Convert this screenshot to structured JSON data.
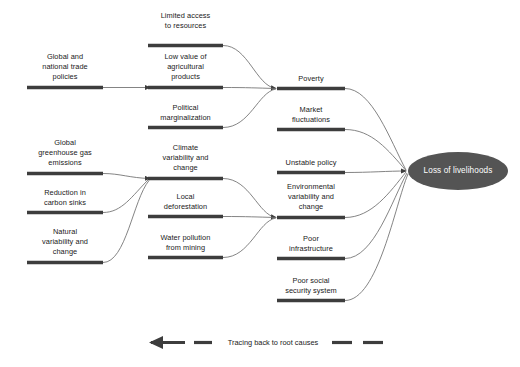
{
  "diagram": {
    "type": "root-cause-tracing-diagram",
    "colors": {
      "bar": "#3d3d3d",
      "connector": "#6e6e6e",
      "ellipse_fill": "#545454",
      "ellipse_text": "#ffffff",
      "text": "#1a1a1a",
      "background": "#ffffff"
    },
    "columns": [
      {
        "id": "root-causes",
        "nodes": [
          {
            "id": "global-national-trade-policies",
            "label": "Global and\nnational trade\npolicies",
            "bar_x": 27,
            "bar_w": 76,
            "bar_y": 87,
            "label_y": 52
          },
          {
            "id": "global-greenhouse-gas-emissions",
            "label": "Global\ngreenhouse gas\nemissions",
            "bar_x": 27,
            "bar_w": 76,
            "bar_y": 173,
            "label_y": 138
          },
          {
            "id": "reduction-in-carbon-sinks",
            "label": "Reduction in\ncarbon sinks",
            "bar_x": 27,
            "bar_w": 76,
            "bar_y": 212,
            "label_y": 188
          },
          {
            "id": "natural-variability-and-change",
            "label": "Natural\nvariability and\nchange",
            "bar_x": 27,
            "bar_w": 76,
            "bar_y": 262,
            "label_y": 227
          }
        ]
      },
      {
        "id": "intermediate-causes",
        "nodes": [
          {
            "id": "limited-access-to-resources",
            "label": "Limited access\nto resources",
            "bar_x": 148,
            "bar_w": 75,
            "bar_y": 45,
            "label_y": 21
          },
          {
            "id": "low-value-of-agricultural-products",
            "label": "Low value of\nagricultural\nproducts",
            "bar_x": 148,
            "bar_w": 75,
            "bar_y": 87,
            "label_y": 52
          },
          {
            "id": "political-marginalization",
            "label": "Political\nmarginalization",
            "bar_x": 148,
            "bar_w": 75,
            "bar_y": 127,
            "label_y": 103
          },
          {
            "id": "climate-variability-and-change",
            "label": "Climate\nvariability and\nchange",
            "bar_x": 148,
            "bar_w": 75,
            "bar_y": 178,
            "label_y": 143
          },
          {
            "id": "local-deforestation",
            "label": "Local\ndeforestation",
            "bar_x": 148,
            "bar_w": 75,
            "bar_y": 216,
            "label_y": 192
          },
          {
            "id": "water-pollution-from-mining",
            "label": "Water pollution\nfrom mining",
            "bar_x": 148,
            "bar_w": 75,
            "bar_y": 257,
            "label_y": 233
          }
        ]
      },
      {
        "id": "proximate-causes",
        "nodes": [
          {
            "id": "poverty",
            "label": "Poverty",
            "bar_x": 277,
            "bar_w": 68,
            "bar_y": 88,
            "label_y": 74
          },
          {
            "id": "market-fluctuations",
            "label": "Market\nfluctuations",
            "bar_x": 277,
            "bar_w": 68,
            "bar_y": 129,
            "label_y": 105
          },
          {
            "id": "unstable-policy",
            "label": "Unstable policy",
            "bar_x": 277,
            "bar_w": 68,
            "bar_y": 172,
            "label_y": 158
          },
          {
            "id": "environmental-variability-and-change",
            "label": "Environmental\nvariability and\nchange",
            "bar_x": 277,
            "bar_w": 68,
            "bar_y": 217,
            "label_y": 182
          },
          {
            "id": "poor-infrastructure",
            "label": "Poor\ninfrastructure",
            "bar_x": 277,
            "bar_w": 68,
            "bar_y": 258,
            "label_y": 234
          },
          {
            "id": "poor-social-security-system",
            "label": "Poor social\nsecurity system",
            "bar_x": 277,
            "bar_w": 68,
            "bar_y": 300,
            "label_y": 276
          }
        ]
      }
    ],
    "outcome": {
      "id": "loss-of-livelihoods",
      "label": "Loss of livelihoods",
      "cx": 458,
      "cy": 171,
      "rx": 50,
      "ry": 19
    },
    "legend": {
      "id": "tracing-legend",
      "label": "Tracing back to root causes",
      "arrow_direction": "left"
    }
  }
}
